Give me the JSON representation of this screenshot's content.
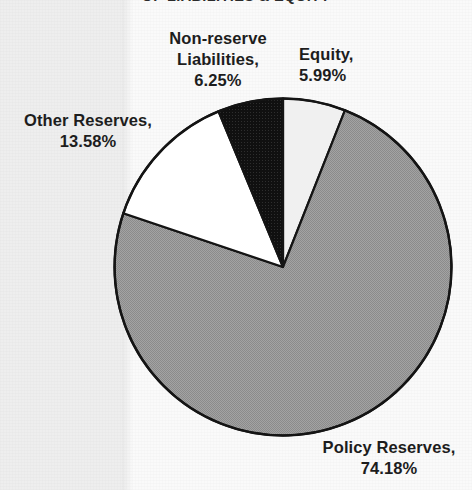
{
  "chart_data": {
    "type": "pie",
    "title": "OF LIABILITIES & EQUITY",
    "categories": [
      "Equity",
      "Policy Reserves",
      "Other Reserves",
      "Non-reserve Liabilities"
    ],
    "values": [
      5.99,
      74.18,
      13.58,
      6.25
    ],
    "unit": "%",
    "start_angle_deg": 0,
    "direction": "clockwise",
    "legend": "none",
    "colors": {
      "Equity": "#f0f0f0",
      "Policy Reserves": "#9a9a9a",
      "Other Reserves": "#ffffff",
      "Non-reserve Liabilities": "#131313",
      "outline": "#141414",
      "background": "#f7f7f7"
    },
    "slices": [
      {
        "name": "Equity",
        "value": 5.99,
        "label": "Equity,\n5.99%",
        "color": "#f0f0f0"
      },
      {
        "name": "Policy Reserves",
        "value": 74.18,
        "label": "Policy Reserves,\n74.18%",
        "color": "#9a9a9a"
      },
      {
        "name": "Other Reserves",
        "value": 13.58,
        "label": "Other Reserves,\n13.58%",
        "color": "#ffffff"
      },
      {
        "name": "Non-reserve Liabilities",
        "value": 6.25,
        "label": "Non-reserve\nLiabilities,\n6.25%",
        "color": "#131313"
      }
    ]
  },
  "labels": {
    "non_reserve": "Non-reserve\nLiabilities,\n6.25%",
    "equity": "Equity,\n5.99%",
    "other_reserves": "Other Reserves,\n13.58%",
    "policy_reserves": "Policy Reserves,\n74.18%"
  }
}
